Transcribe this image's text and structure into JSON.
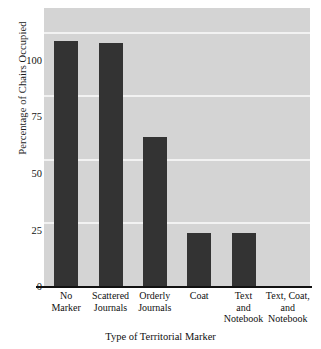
{
  "chart_data": {
    "type": "bar",
    "title": "",
    "subtitle": "",
    "xlabel": "Type of Territorial Marker",
    "ylabel": "Percentage of Chairs Occupied",
    "categories": [
      "No\nMarker",
      "Scattered\nJournals",
      "Orderly\nJournals",
      "Coat",
      "Text\nand\nNotebook",
      "Text, Coat,\nand\nNotebook"
    ],
    "categories_flat": [
      "No Marker",
      "Scattered Journals",
      "Orderly Journals",
      "Coat",
      "Text and Notebook",
      "Text, Coat, and Notebook"
    ],
    "values": [
      97,
      96,
      59,
      21,
      21,
      0
    ],
    "ylim": [
      0,
      110
    ],
    "yticks": [
      0,
      25,
      50,
      75,
      100
    ],
    "ytick_labels": [
      "0",
      "25",
      "50",
      "75",
      "100"
    ],
    "grid": true,
    "grid_axis": "y",
    "legend": "none",
    "bar_color": "#333333",
    "plot_background": "#d4d4d4",
    "gridline_color": "#f2f2f2",
    "axis_color": "#111111",
    "page_background": "#ffffff"
  },
  "axis": {
    "y_title": "Percentage of Chairs Occupied",
    "x_title": "Type of Territorial Marker",
    "y_tick_0": "0",
    "y_tick_25": "25",
    "y_tick_50": "50",
    "y_tick_75": "75",
    "y_tick_100": "100"
  },
  "x_tick_lines": {
    "c0": [
      "No",
      "Marker"
    ],
    "c1": [
      "Scattered",
      "Journals"
    ],
    "c2": [
      "Orderly",
      "Journals"
    ],
    "c3": [
      "Coat"
    ],
    "c4": [
      "Text",
      "and",
      "Notebook"
    ],
    "c5": [
      "Text, Coat,",
      "and",
      "Notebook"
    ]
  }
}
